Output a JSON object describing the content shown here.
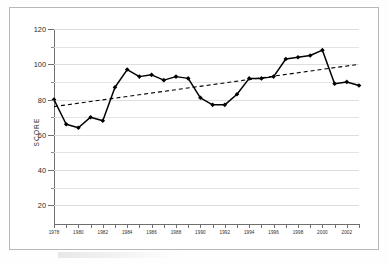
{
  "figure": {
    "axis_title": "SCORE"
  },
  "chart_data": {
    "type": "line",
    "title": "",
    "xlabel": "",
    "ylabel": "SCORE",
    "xlim": [
      1978,
      2003
    ],
    "ylim": [
      10,
      120
    ],
    "grid": true,
    "legend": "none",
    "y_ticks": [
      20,
      40,
      60,
      80,
      100,
      120
    ],
    "y_tick_labels": [
      "20",
      "40",
      "60",
      "80",
      "100",
      "120"
    ],
    "y_minor_ticks": [
      30,
      50,
      70,
      90,
      110
    ],
    "x_ticks": [
      1978,
      1979,
      1980,
      1981,
      1982,
      1983,
      1984,
      1985,
      1986,
      1987,
      1988,
      1989,
      1990,
      1991,
      1992,
      1993,
      1994,
      1995,
      1996,
      1997,
      1998,
      1999,
      2000,
      2001,
      2002,
      2003
    ],
    "x_tick_labels": [
      "1978",
      "1980",
      "1982",
      "1984",
      "1986",
      "1988",
      "1990",
      "1992",
      "1994",
      "1996",
      "1998",
      "2000",
      "2002"
    ],
    "x_labeled_ticks": [
      1978,
      1980,
      1982,
      1984,
      1986,
      1988,
      1990,
      1992,
      1994,
      1996,
      1998,
      2000,
      2002
    ],
    "x": [
      1978,
      1979,
      1980,
      1981,
      1982,
      1983,
      1984,
      1985,
      1986,
      1987,
      1988,
      1989,
      1990,
      1991,
      1992,
      1993,
      1994,
      1995,
      1996,
      1997,
      1998,
      1999,
      2000,
      2001,
      2002,
      2003
    ],
    "values": [
      80,
      66,
      64,
      70,
      68,
      87,
      97,
      93,
      94,
      91,
      93,
      92,
      81,
      77,
      77,
      83,
      92,
      92,
      93,
      103,
      104,
      105,
      108,
      89,
      90,
      88
    ],
    "series": [
      {
        "name": "score",
        "style": "solid-line-with-diamond-markers",
        "color": "#000000",
        "values": [
          80,
          66,
          64,
          70,
          68,
          87,
          97,
          93,
          94,
          91,
          93,
          92,
          81,
          77,
          77,
          83,
          92,
          92,
          93,
          103,
          104,
          105,
          108,
          89,
          90,
          88
        ]
      },
      {
        "name": "trend",
        "style": "dashed-line",
        "color": "#000000",
        "x": [
          1978,
          2003
        ],
        "values": [
          76,
          100
        ]
      }
    ]
  }
}
